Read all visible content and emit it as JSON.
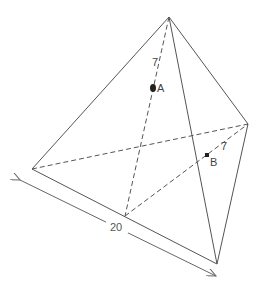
{
  "diagram": {
    "type": "tetrahedron",
    "vertices": {
      "apex": [
        169,
        17
      ],
      "left": [
        32,
        169
      ],
      "back_bottom": [
        125,
        216
      ],
      "right": [
        248,
        124
      ],
      "front_bottom": [
        217,
        264
      ]
    },
    "points": [
      {
        "label": "A",
        "x": 153,
        "y": 88,
        "style": "large-dot"
      },
      {
        "label": "B",
        "x": 207,
        "y": 155,
        "style": "small-dot"
      }
    ],
    "segment_labels": [
      {
        "text": "7",
        "x": 154,
        "y": 62
      },
      {
        "text": "7",
        "x": 223,
        "y": 146
      }
    ],
    "dimension": {
      "text": "20",
      "x": 117,
      "y": 229
    }
  }
}
